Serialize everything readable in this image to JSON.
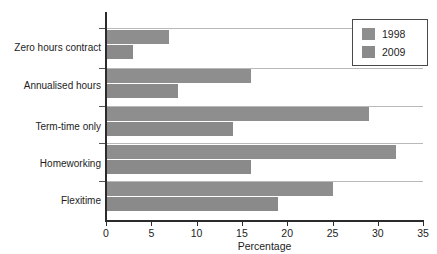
{
  "chart_data": {
    "type": "bar",
    "orientation": "horizontal",
    "title": "",
    "subtitle": "",
    "xlabel": "Percentage",
    "ylabel": "",
    "xlim": [
      0,
      35
    ],
    "xticks": [
      0,
      5,
      10,
      15,
      20,
      25,
      30,
      35
    ],
    "xtick_labels": [
      "0",
      "5",
      "10",
      "15",
      "20",
      "25",
      "30",
      "35"
    ],
    "grid": false,
    "legend_position": "top-right",
    "categories": [
      "Zero hours contract",
      "Annualised hours",
      "Term-time only",
      "Homeworking",
      "Flexitime"
    ],
    "series": [
      {
        "name": "1998",
        "color": "#8e8e8e",
        "values": [
          7,
          16,
          29,
          32,
          25
        ]
      },
      {
        "name": "2009",
        "color": "#8a8a8a",
        "values": [
          3,
          8,
          14,
          16,
          19
        ]
      }
    ]
  },
  "axis": {
    "x_title": "Percentage"
  },
  "legend": {
    "entries": [
      {
        "label": "1998",
        "color": "#8e8e8e"
      },
      {
        "label": "2009",
        "color": "#8a8a8a"
      }
    ]
  }
}
